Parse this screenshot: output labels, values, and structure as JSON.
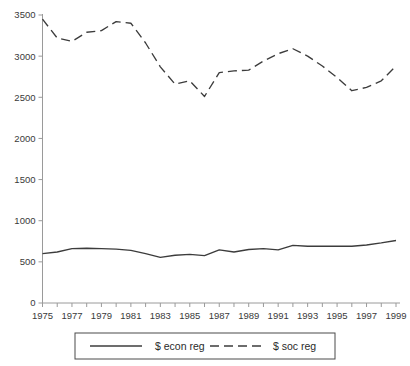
{
  "chart_data": {
    "type": "line",
    "title": "",
    "xlabel": "",
    "ylabel": "",
    "ylim": [
      0,
      3500
    ],
    "xlim": [
      1975,
      1999
    ],
    "grid": false,
    "legend_position": "bottom",
    "ytick_labels": [
      "0",
      "500",
      "1000",
      "1500",
      "2000",
      "2500",
      "3000",
      "3500"
    ],
    "ytick_values": [
      0,
      500,
      1000,
      1500,
      2000,
      2500,
      3000,
      3500
    ],
    "x": [
      1975,
      1976,
      1977,
      1978,
      1979,
      1980,
      1981,
      1982,
      1983,
      1984,
      1985,
      1986,
      1987,
      1988,
      1989,
      1990,
      1991,
      1992,
      1993,
      1994,
      1995,
      1996,
      1997,
      1998,
      1999
    ],
    "xtick_labels": [
      "1975",
      "1977",
      "1979",
      "1981",
      "1983",
      "1985",
      "1987",
      "1989",
      "1991",
      "1993",
      "1995",
      "1997",
      "1999"
    ],
    "xtick_label_values": [
      1975,
      1977,
      1979,
      1981,
      1983,
      1985,
      1987,
      1989,
      1991,
      1993,
      1995,
      1997,
      1999
    ],
    "series": [
      {
        "name": "$ econ reg",
        "style": "solid",
        "color": "#3c3c3c",
        "values": [
          600,
          620,
          660,
          665,
          660,
          655,
          640,
          600,
          555,
          580,
          590,
          575,
          645,
          620,
          650,
          660,
          645,
          700,
          690,
          690,
          690,
          690,
          705,
          730,
          760
        ]
      },
      {
        "name": "$ soc reg",
        "style": "dashed",
        "color": "#3c3c3c",
        "values": [
          3450,
          3220,
          3180,
          3290,
          3310,
          3420,
          3400,
          3160,
          2870,
          2660,
          2700,
          2510,
          2800,
          2820,
          2830,
          2940,
          3030,
          3090,
          3000,
          2880,
          2740,
          2580,
          2620,
          2700,
          2880
        ]
      }
    ],
    "legend": [
      {
        "label": "$ econ reg",
        "style": "solid"
      },
      {
        "label": "$ soc reg",
        "style": "dashed"
      }
    ]
  },
  "colors": {
    "line": "#3c3c3c",
    "axis": "#9a9a9a",
    "text": "#2a2a2a",
    "background": "#ffffff"
  }
}
